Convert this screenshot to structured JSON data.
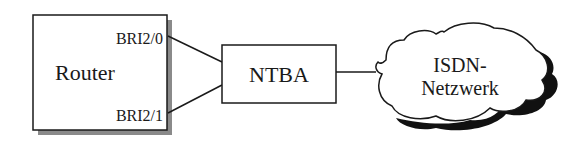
{
  "diagram": {
    "router": {
      "label": "Router",
      "ports": [
        "BRI2/0",
        "BRI2/1"
      ]
    },
    "ntba": {
      "label": "NTBA"
    },
    "network": {
      "label_line1": "ISDN-",
      "label_line2": "Netzwerk"
    },
    "colors": {
      "stroke": "#1a1a1a",
      "shadow_router": "#8a8a8a",
      "shadow_cloud": "#111111",
      "background": "#ffffff"
    }
  }
}
